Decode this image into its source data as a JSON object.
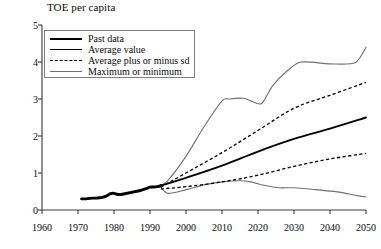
{
  "chart_data": {
    "type": "line",
    "title": "TOE per capita",
    "xlabel": "",
    "ylabel": "TOE per capita",
    "xlim": [
      1960,
      2050
    ],
    "ylim": [
      0,
      5
    ],
    "xticks": [
      1960,
      1970,
      1980,
      1990,
      2000,
      2010,
      2020,
      2030,
      2040,
      2050
    ],
    "yticks": [
      0,
      1,
      2,
      3,
      4,
      5
    ],
    "grid": false,
    "legend_position": "top-left",
    "series": [
      {
        "name": "Past data",
        "style": "solid-thick-black",
        "x": [
          1971,
          1972,
          1973,
          1974,
          1975,
          1976,
          1977,
          1978,
          1979,
          1980,
          1981,
          1982,
          1983,
          1984,
          1985,
          1986,
          1987,
          1988,
          1989,
          1990,
          1991,
          1992,
          1993
        ],
        "values": [
          0.3,
          0.3,
          0.31,
          0.32,
          0.32,
          0.33,
          0.35,
          0.38,
          0.44,
          0.45,
          0.42,
          0.42,
          0.44,
          0.46,
          0.48,
          0.5,
          0.52,
          0.55,
          0.58,
          0.62,
          0.62,
          0.63,
          0.66
        ]
      },
      {
        "name": "Average value",
        "style": "solid-medium-black",
        "x": [
          1993,
          2000,
          2010,
          2020,
          2030,
          2040,
          2050
        ],
        "values": [
          0.66,
          0.87,
          1.2,
          1.58,
          1.92,
          2.2,
          2.5
        ]
      },
      {
        "name": "Average plus or minus sd",
        "style": "dashed-black",
        "upper": {
          "x": [
            1993,
            2000,
            2010,
            2020,
            2030,
            2040,
            2050
          ],
          "values": [
            0.62,
            1.0,
            1.55,
            2.15,
            2.75,
            3.1,
            3.45
          ]
        },
        "lower": {
          "x": [
            1993,
            2000,
            2010,
            2020,
            2030,
            2040,
            2050
          ],
          "values": [
            0.57,
            0.63,
            0.76,
            0.94,
            1.18,
            1.38,
            1.53
          ]
        }
      },
      {
        "name": "Maximum or minimum",
        "style": "solid-thin-gray",
        "maximum": {
          "x": [
            1993,
            1995,
            2000,
            2005,
            2010,
            2012,
            2016,
            2018,
            2021,
            2024,
            2028,
            2032,
            2040,
            2047,
            2050
          ],
          "values": [
            0.66,
            0.8,
            1.45,
            2.25,
            2.95,
            3.0,
            3.02,
            2.95,
            2.88,
            3.35,
            3.75,
            4.0,
            3.95,
            3.98,
            4.4
          ]
        },
        "minimum": {
          "x": [
            1993,
            1995,
            2000,
            2005,
            2010,
            2015,
            2018,
            2022,
            2026,
            2030,
            2036,
            2042,
            2047,
            2050
          ],
          "values": [
            0.62,
            0.45,
            0.55,
            0.68,
            0.76,
            0.79,
            0.76,
            0.66,
            0.6,
            0.6,
            0.55,
            0.49,
            0.4,
            0.35
          ]
        }
      }
    ],
    "annotations": []
  },
  "legend": {
    "items": [
      {
        "label": "Past data",
        "swatch": "solid-thick-black"
      },
      {
        "label": "Average value",
        "swatch": "solid-medium-black"
      },
      {
        "label": "Average plus or minus sd",
        "swatch": "dashed-black"
      },
      {
        "label": "Maximum or minimum",
        "swatch": "solid-thin-gray"
      }
    ]
  },
  "axes": {
    "y_tick_labels": [
      "5",
      "4",
      "3",
      "2",
      "1",
      "0"
    ],
    "x_tick_labels": [
      "1960",
      "1970",
      "1980",
      "1990",
      "2000",
      "2010",
      "2020",
      "2030",
      "2040",
      "2050"
    ]
  },
  "colors": {
    "past_data": "#000000",
    "average": "#000000",
    "sd": "#000000",
    "min_max": "#707070",
    "axis": "#3a3a3a",
    "legend_border": "#808080",
    "background": "#ffffff"
  }
}
